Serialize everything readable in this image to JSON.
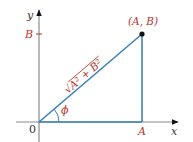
{
  "diagram": {
    "type": "right-triangle-polar",
    "colors": {
      "axis": "#8a8a8a",
      "triangle": "#3b82b8",
      "label": "#b5342c",
      "axis_label": "#333333",
      "point": "#111111"
    },
    "axes": {
      "x_label": "x",
      "y_label": "y",
      "origin_label": "0"
    },
    "ticks": {
      "x_tick_label": "A",
      "y_tick_label": "B"
    },
    "point": {
      "label": "(A, B)"
    },
    "hypotenuse_label": "√A² + B²",
    "angle_label": "ϕ"
  }
}
